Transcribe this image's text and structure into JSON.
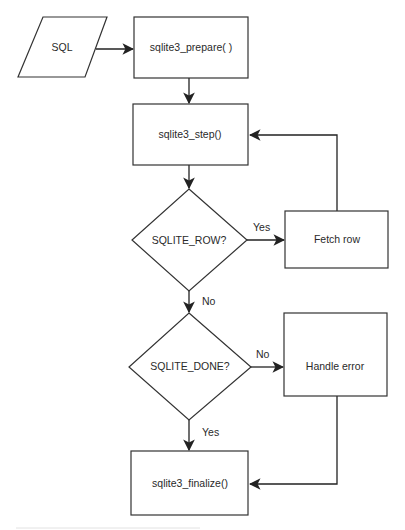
{
  "diagram": {
    "type": "flowchart",
    "colors": {
      "stroke": "#333333",
      "text": "#2a2a2a",
      "background": "#ffffff"
    },
    "nodes": {
      "sql": {
        "shape": "parallelogram",
        "label": "SQL"
      },
      "prepare": {
        "shape": "process",
        "label": "sqlite3_prepare( )"
      },
      "step": {
        "shape": "process",
        "label": "sqlite3_step()"
      },
      "row_check": {
        "shape": "decision",
        "label": "SQLITE_ROW?"
      },
      "fetch": {
        "shape": "process",
        "label": "Fetch row"
      },
      "done_check": {
        "shape": "decision",
        "label": "SQLITE_DONE?"
      },
      "error": {
        "shape": "process",
        "label": "Handle error"
      },
      "finalize": {
        "shape": "process",
        "label": "sqlite3_finalize()"
      }
    },
    "edges": [
      {
        "from": "sql",
        "to": "prepare",
        "label": ""
      },
      {
        "from": "prepare",
        "to": "step",
        "label": ""
      },
      {
        "from": "step",
        "to": "row_check",
        "label": ""
      },
      {
        "from": "row_check",
        "to": "fetch",
        "label": "Yes"
      },
      {
        "from": "fetch",
        "to": "step",
        "label": ""
      },
      {
        "from": "row_check",
        "to": "done_check",
        "label": "No"
      },
      {
        "from": "done_check",
        "to": "error",
        "label": "No"
      },
      {
        "from": "done_check",
        "to": "finalize",
        "label": "Yes"
      },
      {
        "from": "error",
        "to": "finalize",
        "label": ""
      }
    ],
    "edge_labels": {
      "row_yes": "Yes",
      "row_no": "No",
      "done_no": "No",
      "done_yes": "Yes"
    }
  }
}
